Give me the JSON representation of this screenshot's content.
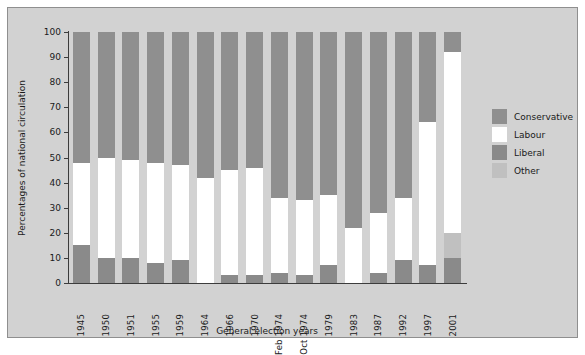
{
  "chart_data": {
    "type": "bar",
    "subtype": "stacked-100-percent",
    "title": "",
    "xlabel": "General election years",
    "ylabel": "Percentages of national circulation",
    "ylim": [
      0,
      100
    ],
    "ytick_step": 10,
    "yticks": [
      0,
      10,
      20,
      30,
      40,
      50,
      60,
      70,
      80,
      90,
      100
    ],
    "grid": false,
    "legend_position": "right",
    "categories": [
      "1945",
      "1950",
      "1951",
      "1955",
      "1959",
      "1964",
      "1966",
      "1970",
      "Feb 1974",
      "Oct 1974",
      "1979",
      "1983",
      "1987",
      "1992",
      "1997",
      "2001"
    ],
    "series": [
      {
        "name": "Liberal",
        "color": "#8a8a8a",
        "values": [
          15,
          10,
          10,
          8,
          9,
          0,
          3,
          3,
          4,
          3,
          7,
          0,
          4,
          9,
          7,
          10
        ]
      },
      {
        "name": "Other",
        "color": "#c0c0c0",
        "values": [
          0,
          0,
          0,
          0,
          0,
          0,
          0,
          0,
          0,
          0,
          0,
          0,
          0,
          0,
          0,
          10
        ]
      },
      {
        "name": "Labour",
        "color": "#ffffff",
        "values": [
          33,
          40,
          39,
          40,
          38,
          42,
          42,
          43,
          30,
          30,
          28,
          22,
          24,
          25,
          57,
          72
        ]
      },
      {
        "name": "Conservative",
        "color": "#8f8f8f",
        "values": [
          52,
          50,
          51,
          52,
          53,
          58,
          55,
          54,
          66,
          67,
          65,
          78,
          72,
          66,
          36,
          8
        ]
      }
    ],
    "stack_order_bottom_to_top": [
      "Liberal",
      "Other",
      "Labour",
      "Conservative"
    ]
  },
  "legend": {
    "items": [
      {
        "label": "Conservative",
        "color": "#8f8f8f"
      },
      {
        "label": "Labour",
        "color": "#ffffff"
      },
      {
        "label": "Liberal",
        "color": "#8a8a8a"
      },
      {
        "label": "Other",
        "color": "#c0c0c0"
      }
    ]
  }
}
